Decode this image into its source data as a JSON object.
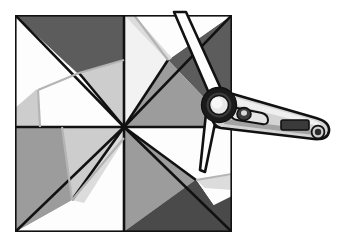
{
  "image": {
    "title": "Grayscale geometric quilt-block pattern with digital angle finder",
    "width": 343,
    "height": 242,
    "background_color": "#ffffff",
    "alt_text": "A square divided into four quadrants forming a pinwheel of white, light gray, medium gray and dark gray triangles, with a digital angle-finder protractor laid across its right edge."
  },
  "palette": {
    "white": "#fdfdfd",
    "off_white": "#f2f2f2",
    "light_gray": "#cdcdcd",
    "light_gray_2": "#dcdcdc",
    "medium_gray": "#9c9c9c",
    "medium_gray_2": "#a8a8a8",
    "dark_gray": "#5c5c5c",
    "darker_gray": "#4a4a4a",
    "outline": "#111111",
    "tool_body": "#d4d4d4",
    "tool_body_light": "#ececec",
    "tool_shadow": "#8f8f8f",
    "tool_hub_ring": "#1a1a1a",
    "tool_hub_inner": "#e8e8e8",
    "tool_display": "#3a3a3a",
    "tool_button": "#2b2b2b"
  },
  "pattern": {
    "name": "pinwheel-quilt-block",
    "square": {
      "left": 15,
      "top": 15,
      "right": 232,
      "bottom": 232
    },
    "center": {
      "x": 124,
      "y": 127
    },
    "quadrants": [
      {
        "name": "top-left",
        "shapes": [
          {
            "id": "tl-dark-triangle",
            "tone": "dark_gray"
          },
          {
            "id": "tl-white-wedge",
            "tone": "white"
          },
          {
            "id": "tl-light-band",
            "tone": "light_gray"
          },
          {
            "id": "tl-medium-strip",
            "tone": "medium_gray"
          }
        ]
      },
      {
        "name": "top-right",
        "shapes": [
          {
            "id": "tr-white-kite",
            "tone": "white"
          },
          {
            "id": "tr-off-white-triangle",
            "tone": "off_white"
          },
          {
            "id": "tr-dark-triangle",
            "tone": "dark_gray"
          },
          {
            "id": "tr-medium-triangle",
            "tone": "medium_gray"
          }
        ]
      },
      {
        "name": "bottom-left",
        "shapes": [
          {
            "id": "bl-medium-band",
            "tone": "medium_gray"
          },
          {
            "id": "bl-light-wedge",
            "tone": "light_gray"
          },
          {
            "id": "bl-white-triangle",
            "tone": "white"
          }
        ]
      },
      {
        "name": "bottom-right",
        "shapes": [
          {
            "id": "br-medium-triangle",
            "tone": "medium_gray"
          },
          {
            "id": "br-white-triangle",
            "tone": "white"
          },
          {
            "id": "br-dark-triangle",
            "tone": "darker_gray"
          },
          {
            "id": "br-light-sliver",
            "tone": "light_gray_2"
          }
        ]
      }
    ]
  },
  "tool": {
    "name": "digital-angle-finder",
    "type": "protractor",
    "hub": {
      "cx": 219,
      "cy": 105,
      "outer_radius": 17,
      "inner_radius": 9
    },
    "parts": [
      {
        "id": "upper-blade",
        "label": "upper measuring blade"
      },
      {
        "id": "lower-blade",
        "label": "lower measuring blade"
      },
      {
        "id": "hub-ring",
        "label": "pivot hub"
      },
      {
        "id": "handle",
        "label": "handle body"
      },
      {
        "id": "lock-knob",
        "label": "lock knob"
      },
      {
        "id": "display",
        "label": "digital display"
      },
      {
        "id": "power-button",
        "label": "power button"
      }
    ],
    "display_value": ""
  }
}
